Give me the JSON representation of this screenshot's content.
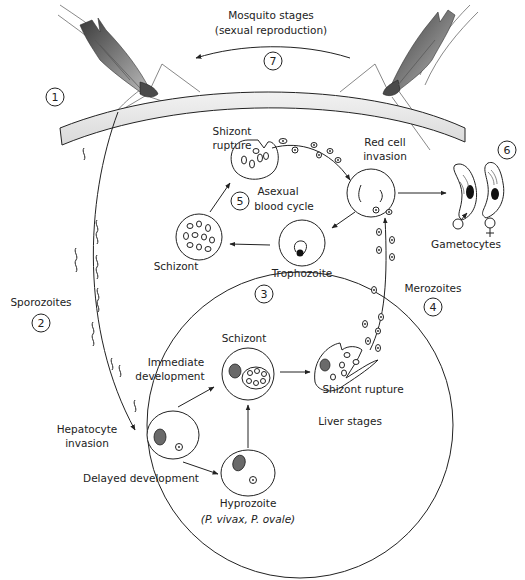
{
  "mosquito": {
    "title": "Mosquito stages",
    "subtitle": "(sexual reproduction)",
    "step": "7"
  },
  "steps": {
    "s1": "1",
    "s2": "2",
    "s3": "3",
    "s4": "4",
    "s5": "5",
    "s6": "6",
    "s7": "7"
  },
  "labels": {
    "sporozoites": "Sporozoites",
    "shizont_rupture_top_1": "Shizont",
    "shizont_rupture_top_2": "rupture",
    "asexual_1": "Asexual",
    "asexual_2": "blood cycle",
    "red_cell_1": "Red cell",
    "red_cell_2": "invasion",
    "gametocytes": "Gametocytes",
    "schizont_blood": "Schizont",
    "trophozoite": "Trophozoite",
    "merozoites": "Merozoites",
    "immediate_1": "Immediate",
    "immediate_2": "development",
    "schizont_liver": "Schizont",
    "shizont_rupture_liver": "Shizont rupture",
    "liver_stages": "Liver stages",
    "hepatocyte_1": "Hepatocyte",
    "hepatocyte_2": "invasion",
    "delayed": "Delayed development",
    "hyprozoite": "Hyprozoite",
    "species": "(P. vivax, P. ovale)"
  },
  "colors": {
    "line": "#222222",
    "nucleus": "#6a6a6a",
    "skin": "#e6e6e6",
    "mosquito_dark": "#4a4a4a",
    "background": "#ffffff"
  }
}
